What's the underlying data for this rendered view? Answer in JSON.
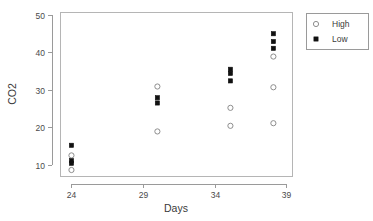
{
  "chart_data": {
    "type": "scatter",
    "title": "",
    "xlabel": "Days",
    "ylabel": "CO2",
    "xlim": [
      23.2,
      39.4
    ],
    "ylim": [
      7.0,
      50.8
    ],
    "xticks": [
      24,
      29,
      34,
      39
    ],
    "xtick_labels": [
      "24",
      "29",
      "34",
      "39"
    ],
    "yticks": [
      10,
      20,
      30,
      40,
      50
    ],
    "ytick_labels": [
      "10",
      "20",
      "30",
      "40",
      "50"
    ],
    "grid": false,
    "legend_position": "right-top",
    "legend": [
      {
        "name": "High",
        "marker": "open-circle",
        "color": "#8e8e8e"
      },
      {
        "name": "Low",
        "marker": "filled-square",
        "color": "#111111"
      }
    ],
    "series": [
      {
        "name": "High",
        "marker": "open-circle",
        "color": "#8e8e8e",
        "points": [
          {
            "x": 24.0,
            "y": 12.5
          },
          {
            "x": 24.0,
            "y": 8.6
          },
          {
            "x": 30.0,
            "y": 30.9
          },
          {
            "x": 30.0,
            "y": 18.9
          },
          {
            "x": 35.1,
            "y": 25.2
          },
          {
            "x": 35.1,
            "y": 20.4
          },
          {
            "x": 38.1,
            "y": 38.9
          },
          {
            "x": 38.1,
            "y": 30.7
          },
          {
            "x": 38.1,
            "y": 21.1
          }
        ]
      },
      {
        "name": "Low",
        "marker": "filled-square",
        "color": "#111111",
        "points": [
          {
            "x": 24.0,
            "y": 15.2
          },
          {
            "x": 24.0,
            "y": 11.1
          },
          {
            "x": 24.0,
            "y": 10.4
          },
          {
            "x": 30.0,
            "y": 27.9
          },
          {
            "x": 30.0,
            "y": 26.5
          },
          {
            "x": 35.1,
            "y": 35.5
          },
          {
            "x": 35.1,
            "y": 34.4
          },
          {
            "x": 35.1,
            "y": 32.4
          },
          {
            "x": 38.1,
            "y": 45.0
          },
          {
            "x": 38.1,
            "y": 42.9
          },
          {
            "x": 38.1,
            "y": 41.1
          }
        ]
      }
    ]
  },
  "plot_geometry": {
    "left": 60,
    "right": 292,
    "top": 12,
    "bottom": 176
  },
  "legend_geometry": {
    "x": 306,
    "y": 13,
    "width": 62,
    "height": 36
  }
}
